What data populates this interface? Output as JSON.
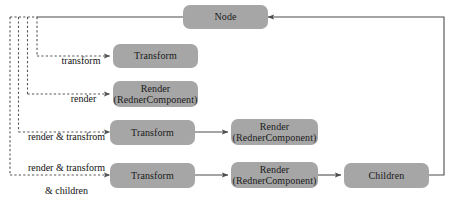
{
  "diagram": {
    "colors": {
      "box_fill": "#a6a6a6",
      "box_text": "#1a1a1a",
      "edge_solid": "#4d4d4d",
      "edge_dashed": "#555555",
      "background": "#ffffff"
    },
    "nodes": [
      {
        "id": "node",
        "label": "Node"
      },
      {
        "id": "transform-1",
        "label": "Transform"
      },
      {
        "id": "render-1",
        "label_line1": "Render",
        "label_line2": "(RednerComponent)"
      },
      {
        "id": "transform-2",
        "label": "Transform"
      },
      {
        "id": "render-2",
        "label_line1": "Render",
        "label_line2": "(RednerComponent)"
      },
      {
        "id": "transform-3",
        "label": "Transform"
      },
      {
        "id": "render-3",
        "label_line1": "Render",
        "label_line2": "(RednerComponent)"
      },
      {
        "id": "children",
        "label": "Children"
      }
    ],
    "edge_labels": [
      {
        "id": "branch-1",
        "text": "transform"
      },
      {
        "id": "branch-2",
        "text": "render"
      },
      {
        "id": "branch-3",
        "text": "render & transfrom"
      },
      {
        "id": "branch-4",
        "line1": "render & transform",
        "line2": "& children"
      }
    ]
  }
}
